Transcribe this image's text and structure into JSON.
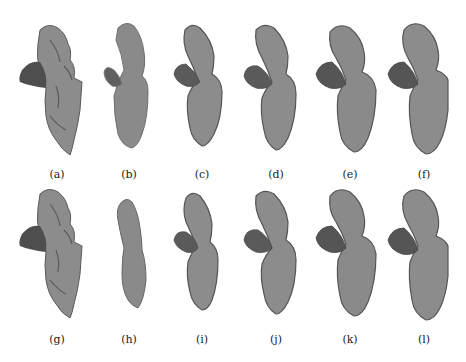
{
  "figure": {
    "colors": {
      "background": "#ffffff",
      "body_fill": "#8c8c8c",
      "body_edge": "#5a5a5a",
      "lobe_fill": "#5e5e5e",
      "lobe_dark": "#4a4a4a"
    },
    "rows": [
      {
        "panels": [
          {
            "label": "(a)",
            "kind": "detailed"
          },
          {
            "label": "(b)",
            "kind": "smooth"
          },
          {
            "label": "(c)",
            "kind": "mid"
          },
          {
            "label": "(d)",
            "kind": "mid"
          },
          {
            "label": "(e)",
            "kind": "mid-detailed"
          },
          {
            "label": "(f)",
            "kind": "mid-detailed"
          }
        ]
      },
      {
        "panels": [
          {
            "label": "(g)",
            "kind": "detailed"
          },
          {
            "label": "(h)",
            "kind": "smooth-no-lobe"
          },
          {
            "label": "(i)",
            "kind": "mid"
          },
          {
            "label": "(j)",
            "kind": "mid"
          },
          {
            "label": "(k)",
            "kind": "mid-detailed"
          },
          {
            "label": "(l)",
            "kind": "mid-detailed"
          }
        ]
      }
    ]
  }
}
